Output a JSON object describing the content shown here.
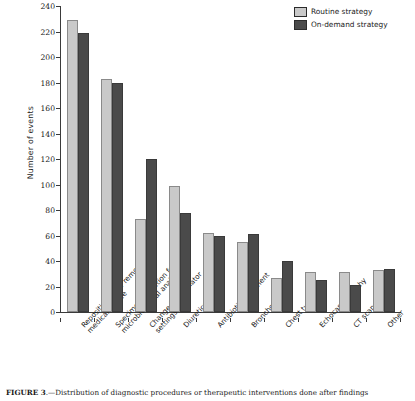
{
  "chart_data": {
    "type": "bar",
    "title": "",
    "xlabel": "",
    "ylabel": "Number of events",
    "ylim": [
      0,
      240
    ],
    "ytick_step": 20,
    "yticks": [
      0,
      20,
      40,
      60,
      80,
      100,
      120,
      140,
      160,
      180,
      200,
      220,
      240
    ],
    "grid": false,
    "legend_position": "top-right",
    "categories": [
      "Repositioning or removal of a medical device",
      "Specimen collection for microbiological analysis",
      "Change in ventilator settings",
      "Diuretics",
      "Antibiotic treatment",
      "Bronchoscopy",
      "Chest tube",
      "Echocardiography",
      "CT scan",
      "Other"
    ],
    "category_lines": [
      [
        "Repositioning or removal of a",
        "medical device"
      ],
      [
        "Specimen collection for",
        "microbiological analysis"
      ],
      [
        "Change in ventilator",
        "settings"
      ],
      [
        "Diuretics"
      ],
      [
        "Antibiotic treatment"
      ],
      [
        "Bronchoscopy"
      ],
      [
        "Chest tube"
      ],
      [
        "Echocardiography"
      ],
      [
        "CT scan"
      ],
      [
        "Other"
      ]
    ],
    "series": [
      {
        "name": "Routine strategy",
        "color": "#c9c9c9",
        "values": [
          229,
          183,
          73,
          99,
          62,
          55,
          27,
          31,
          31,
          33
        ]
      },
      {
        "name": "On-demand strategy",
        "color": "#4a4a4a",
        "values": [
          219,
          180,
          120,
          78,
          60,
          61,
          40,
          25,
          21,
          34
        ]
      }
    ]
  },
  "legend": {
    "items": [
      {
        "label": "Routine strategy",
        "color": "#c9c9c9"
      },
      {
        "label": "On-demand strategy",
        "color": "#4a4a4a"
      }
    ]
  },
  "caption": {
    "prefix": "FIGURE 3",
    "text": ".—Distribution of diagnostic procedures or therapeutic interventions done after findings"
  }
}
